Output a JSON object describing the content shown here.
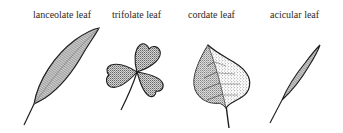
{
  "figure": {
    "background": "#ffffff",
    "ink_color": "#1e1e1e",
    "leaves": [
      {
        "id": "lanceolate",
        "label": "lanceolate leaf"
      },
      {
        "id": "trifolate",
        "label": "trifolate leaf"
      },
      {
        "id": "cordate",
        "label": "cordate leaf"
      },
      {
        "id": "acicular",
        "label": "acicular leaf"
      }
    ]
  }
}
